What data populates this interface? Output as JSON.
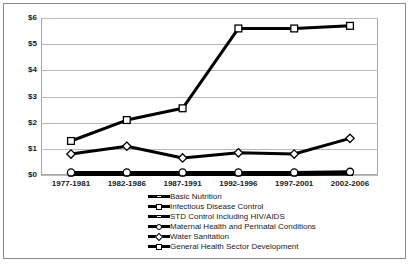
{
  "chart_data": {
    "type": "line",
    "title": "",
    "xlabel": "",
    "ylabel": "",
    "ylim": [
      0,
      6
    ],
    "grid": true,
    "legend_position": "bottom",
    "categories": [
      "1977-1981",
      "1982-1986",
      "1987-1991",
      "1992-1996",
      "1997-2001",
      "2002-2006"
    ],
    "ytick_labels": [
      "$0",
      "$1",
      "$2",
      "$3",
      "$4",
      "$5",
      "$6"
    ],
    "ytick_values": [
      0,
      1,
      2,
      3,
      4,
      5,
      6
    ],
    "series": [
      {
        "name": "Basic Nutrition",
        "marker": "dash",
        "values": [
          0.04,
          0.04,
          0.04,
          0.04,
          0.04,
          0.04
        ]
      },
      {
        "name": "Infectious Disease Control",
        "marker": "square-small",
        "values": [
          0.06,
          0.06,
          0.06,
          0.06,
          0.06,
          0.08
        ]
      },
      {
        "name": "STD Control Including HIV/AIDS",
        "marker": "dash",
        "values": [
          0.02,
          0.02,
          0.02,
          0.02,
          0.02,
          0.05
        ]
      },
      {
        "name": "Maternal Health and Perinatal Conditions",
        "marker": "circle",
        "values": [
          0.1,
          0.1,
          0.1,
          0.1,
          0.1,
          0.12
        ]
      },
      {
        "name": "Water Sanitation",
        "marker": "diamond",
        "values": [
          0.8,
          1.1,
          0.65,
          0.85,
          0.8,
          1.4
        ]
      },
      {
        "name": "General Health Sector Development",
        "marker": "square",
        "values": [
          1.3,
          2.1,
          2.55,
          5.6,
          5.6,
          5.7
        ]
      }
    ]
  }
}
